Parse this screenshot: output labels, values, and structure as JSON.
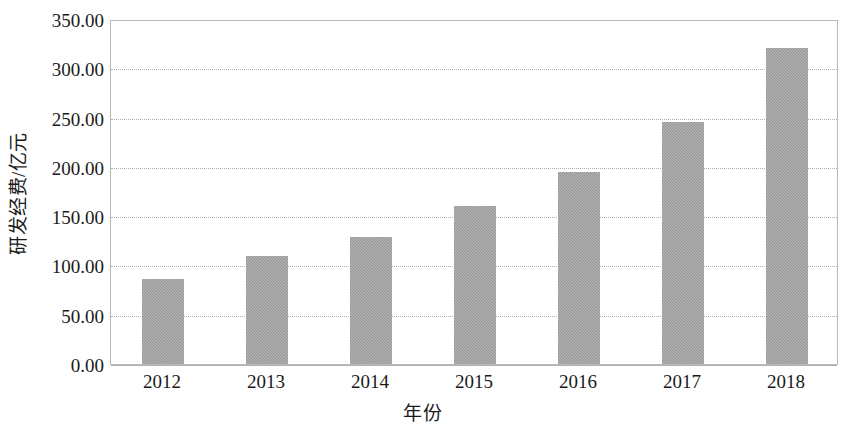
{
  "chart_data": {
    "type": "bar",
    "title": "",
    "subtitle": "",
    "xlabel": "年份",
    "ylabel": "研发经费/亿元",
    "categories": [
      "2012",
      "2013",
      "2014",
      "2015",
      "2016",
      "2017",
      "2018"
    ],
    "values": [
      86,
      110,
      129,
      160,
      195,
      246,
      321
    ],
    "series": [
      {
        "name": "研发经费",
        "values": [
          86,
          110,
          129,
          160,
          195,
          246,
          321
        ]
      }
    ],
    "ylim": [
      0,
      350
    ],
    "ytick_step": 50,
    "ytick_labels": [
      "0.00",
      "50.00",
      "100.00",
      "150.00",
      "200.00",
      "250.00",
      "300.00",
      "350.00"
    ],
    "ytick_values": [
      0,
      50,
      100,
      150,
      200,
      250,
      300,
      350
    ],
    "xtick_labels": [
      "2012",
      "2013",
      "2014",
      "2015",
      "2016",
      "2017",
      "2018"
    ],
    "grid": true,
    "grid_axis": "y",
    "grid_style": "dotted",
    "legend": false,
    "legend_position": "none",
    "bar_color": "#9b9b9b",
    "grid_color": "#b0b0b0",
    "axis_color": "#b9b9b9",
    "text_color": "#1a1a1a",
    "background_color": "#ffffff",
    "annotations": []
  }
}
